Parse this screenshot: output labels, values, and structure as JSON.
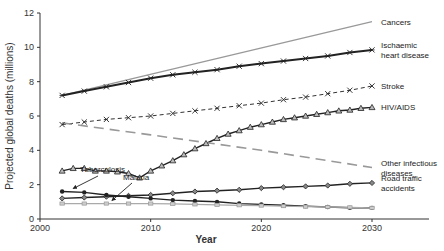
{
  "chart_data": {
    "type": "line",
    "title": "",
    "xlabel": "Year",
    "ylabel": "Projected global deaths (millions)",
    "xlim": [
      2000,
      2030
    ],
    "ylim": [
      0,
      12
    ],
    "xticks": [
      2000,
      2010,
      2020,
      2030
    ],
    "yticks": [
      0,
      2,
      4,
      6,
      8,
      10,
      12
    ],
    "grid": false,
    "legend": "inline-right",
    "series": [
      {
        "name": "Cancers",
        "label_lines": [
          "Cancers"
        ],
        "marker": "none",
        "style": "solid-gray",
        "color": "#999999",
        "x": [
          2002,
          2030
        ],
        "y": [
          7.2,
          11.5
        ]
      },
      {
        "name": "Ischaemic heart disease",
        "label_lines": [
          "Ischaemic",
          "heart disease"
        ],
        "marker": "star",
        "style": "solid",
        "color": "#222222",
        "x": [
          2002,
          2004,
          2006,
          2008,
          2010,
          2012,
          2014,
          2016,
          2018,
          2020,
          2022,
          2024,
          2026,
          2028,
          2030
        ],
        "y": [
          7.2,
          7.45,
          7.7,
          7.95,
          8.2,
          8.4,
          8.55,
          8.7,
          8.9,
          9.05,
          9.2,
          9.35,
          9.5,
          9.7,
          9.85
        ]
      },
      {
        "name": "Stroke",
        "label_lines": [
          "Stroke"
        ],
        "marker": "x",
        "style": "dotted",
        "color": "#333333",
        "x": [
          2002,
          2004,
          2006,
          2008,
          2010,
          2012,
          2014,
          2016,
          2018,
          2020,
          2022,
          2024,
          2026,
          2028,
          2030
        ],
        "y": [
          5.5,
          5.65,
          5.8,
          5.9,
          6.0,
          6.15,
          6.3,
          6.45,
          6.6,
          6.75,
          6.95,
          7.1,
          7.3,
          7.5,
          7.75
        ]
      },
      {
        "name": "HIV/AIDS",
        "label_lines": [
          "HIV/AIDS"
        ],
        "marker": "triangle",
        "style": "solid",
        "color": "#222222",
        "x": [
          2002,
          2003,
          2004,
          2005,
          2006,
          2007,
          2008,
          2009,
          2010,
          2011,
          2012,
          2013,
          2014,
          2015,
          2016,
          2017,
          2018,
          2019,
          2020,
          2021,
          2022,
          2023,
          2024,
          2025,
          2026,
          2027,
          2028,
          2029,
          2030
        ],
        "y": [
          2.8,
          2.95,
          2.95,
          2.8,
          2.8,
          2.75,
          2.65,
          2.4,
          2.8,
          3.1,
          3.4,
          3.75,
          4.1,
          4.4,
          4.7,
          4.95,
          5.15,
          5.35,
          5.5,
          5.65,
          5.8,
          5.9,
          6.0,
          6.1,
          6.2,
          6.3,
          6.35,
          6.45,
          6.5
        ]
      },
      {
        "name": "Other infectious diseases",
        "label_lines": [
          "Other infectious",
          "diseases"
        ],
        "marker": "none",
        "style": "dashed-gray",
        "color": "#999999",
        "x": [
          2002,
          2010,
          2020,
          2030
        ],
        "y": [
          5.6,
          4.9,
          4.0,
          3.0
        ]
      },
      {
        "name": "Road traffic accidents",
        "label_lines": [
          "Road traffic",
          "accidents"
        ],
        "marker": "diamond",
        "style": "solid",
        "color": "#222222",
        "x": [
          2002,
          2004,
          2006,
          2008,
          2010,
          2012,
          2014,
          2016,
          2018,
          2020,
          2022,
          2024,
          2026,
          2028,
          2030
        ],
        "y": [
          1.2,
          1.25,
          1.3,
          1.35,
          1.4,
          1.5,
          1.6,
          1.65,
          1.7,
          1.8,
          1.85,
          1.9,
          1.95,
          2.05,
          2.1
        ]
      },
      {
        "name": "Tuberculosis",
        "label_lines": [],
        "marker": "dot",
        "style": "solid",
        "color": "#222222",
        "x": [
          2002,
          2004,
          2006,
          2008,
          2010,
          2012,
          2014,
          2016,
          2018,
          2020,
          2022,
          2024,
          2026,
          2028,
          2030
        ],
        "y": [
          1.6,
          1.55,
          1.4,
          1.3,
          1.2,
          1.1,
          1.05,
          1.0,
          0.9,
          0.85,
          0.8,
          0.75,
          0.7,
          0.65,
          0.65
        ]
      },
      {
        "name": "Malaria",
        "label_lines": [],
        "marker": "square",
        "style": "solid-gray",
        "color": "#aaaaaa",
        "x": [
          2002,
          2004,
          2006,
          2008,
          2010,
          2012,
          2014,
          2016,
          2018,
          2020,
          2022,
          2024,
          2026,
          2028,
          2030
        ],
        "y": [
          0.9,
          0.9,
          0.9,
          0.9,
          0.9,
          0.88,
          0.85,
          0.82,
          0.8,
          0.78,
          0.75,
          0.72,
          0.7,
          0.68,
          0.65
        ]
      }
    ],
    "annotations": [
      {
        "text": "Tuberculosis",
        "points_to": "Tuberculosis",
        "at_x": 2003
      },
      {
        "text": "Malaria",
        "points_to": "Malaria",
        "at_x": 2006.5
      }
    ]
  }
}
